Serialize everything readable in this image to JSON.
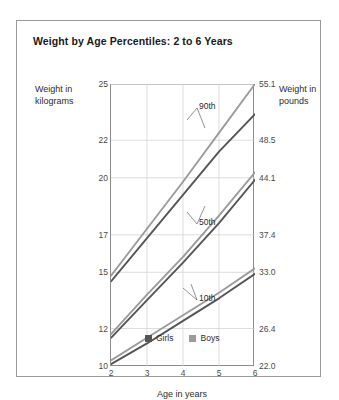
{
  "title": "Weight by Age Percentiles: 2 to 6 Years",
  "axes": {
    "left_caption": "Weight in kilograms",
    "right_caption": "Weight in pounds",
    "x_caption": "Age in years"
  },
  "legend": {
    "items": [
      {
        "label": "Girls",
        "color": "#555555"
      },
      {
        "label": "Boys",
        "color": "#9b9b9b"
      }
    ]
  },
  "annotations": [
    {
      "label": "90th"
    },
    {
      "label": "50th"
    },
    {
      "label": "10th"
    }
  ],
  "chart_data": {
    "type": "line",
    "title": "Weight by Age Percentiles: 2 to 6 Years",
    "xlabel": "Age in years",
    "ylabel": "Weight in kilograms",
    "ylabel_right": "Weight in pounds",
    "x": [
      2,
      3,
      4,
      5,
      6
    ],
    "xlim": [
      2,
      6
    ],
    "xticks": [
      "2",
      "3",
      "4",
      "5",
      "6"
    ],
    "ylim_kg": [
      10,
      25
    ],
    "yticks_kg": [
      "25",
      "22",
      "20",
      "17",
      "15",
      "12",
      "10"
    ],
    "ytick_values_kg": [
      25,
      22,
      20,
      17,
      15,
      12,
      10
    ],
    "ylim_lb": [
      22.0,
      55.1
    ],
    "yticks_lb": [
      "55.1",
      "48.5",
      "44.1",
      "37.4",
      "33.0",
      "26.4",
      "22.0"
    ],
    "ytick_values_lb": [
      55.1,
      48.5,
      44.1,
      37.4,
      33.0,
      26.4,
      22.0
    ],
    "grid": true,
    "legend_position": "bottom-left-inside",
    "series": [
      {
        "name": "Boys 90th",
        "percentile": "90th",
        "sex": "Boys",
        "color": "#9b9b9b",
        "values": [
          14.8,
          17.3,
          19.8,
          22.4,
          25.0
        ]
      },
      {
        "name": "Girls 90th",
        "percentile": "90th",
        "sex": "Girls",
        "color": "#555555",
        "values": [
          14.5,
          16.8,
          19.1,
          21.4,
          23.4
        ]
      },
      {
        "name": "Boys 50th",
        "percentile": "50th",
        "sex": "Boys",
        "color": "#9b9b9b",
        "values": [
          11.7,
          13.8,
          15.8,
          18.0,
          20.3
        ]
      },
      {
        "name": "Girls 50th",
        "percentile": "50th",
        "sex": "Girls",
        "color": "#555555",
        "values": [
          11.5,
          13.5,
          15.5,
          17.6,
          19.9
        ]
      },
      {
        "name": "Boys 10th",
        "percentile": "10th",
        "sex": "Boys",
        "color": "#9b9b9b",
        "values": [
          10.3,
          11.5,
          12.7,
          13.9,
          15.2
        ]
      },
      {
        "name": "Girls 10th",
        "percentile": "10th",
        "sex": "Girls",
        "color": "#555555",
        "values": [
          10.1,
          11.2,
          12.4,
          13.6,
          14.9
        ]
      }
    ]
  }
}
